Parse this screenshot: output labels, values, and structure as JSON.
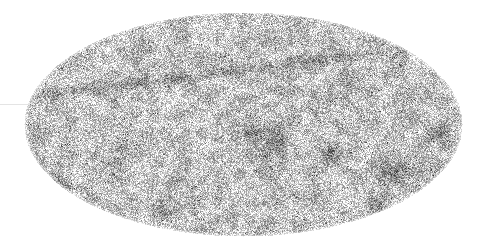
{
  "image": {
    "description": "Grayscale all-sky map in Mollweide (elliptical) projection with fine speckled noise texture, a darker band across the upper-left, and several darker blotches",
    "projection": "mollweide",
    "ellipse": {
      "cx": 243,
      "cy": 124,
      "rx": 219,
      "ry": 112
    },
    "colors": {
      "background": "#ffffff",
      "base": "#cfcfcf",
      "light": "#f2f2f2",
      "dark": "#4a4a4a",
      "band": "#9a9a9a"
    },
    "band": {
      "points": [
        [
          28,
          98
        ],
        [
          120,
          84
        ],
        [
          240,
          70
        ],
        [
          330,
          58
        ],
        [
          410,
          48
        ]
      ],
      "width": 9
    },
    "dark_regions": [
      {
        "x": 270,
        "y": 145,
        "r": 22
      },
      {
        "x": 245,
        "y": 130,
        "r": 12
      },
      {
        "x": 395,
        "y": 170,
        "r": 14
      },
      {
        "x": 440,
        "y": 135,
        "r": 10
      },
      {
        "x": 380,
        "y": 205,
        "r": 10
      },
      {
        "x": 60,
        "y": 185,
        "r": 12
      },
      {
        "x": 120,
        "y": 150,
        "r": 10
      },
      {
        "x": 330,
        "y": 150,
        "r": 9
      },
      {
        "x": 345,
        "y": 75,
        "r": 9
      },
      {
        "x": 170,
        "y": 210,
        "r": 9
      },
      {
        "x": 450,
        "y": 178,
        "r": 8
      }
    ],
    "seed": 7
  }
}
